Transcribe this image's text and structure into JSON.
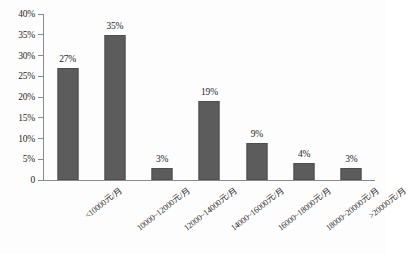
{
  "chart_data": {
    "type": "bar",
    "title": "",
    "xlabel": "",
    "ylabel": "",
    "categories": [
      "<10000元/月",
      "10000~12000元/月",
      "12000~14000元/月",
      "14000~16000元/月",
      "16000~18000元/月",
      "18000~20000元/月",
      ">20000元/月"
    ],
    "values": [
      27,
      35,
      3,
      19,
      9,
      4,
      3
    ],
    "value_labels": [
      "27%",
      "35%",
      "3%",
      "19%",
      "9%",
      "4%",
      "3%"
    ],
    "ylim": [
      0,
      40
    ],
    "ytick_values": [
      0,
      5,
      10,
      15,
      20,
      25,
      30,
      35,
      40
    ],
    "ytick_labels": [
      "0",
      "5%",
      "10%",
      "15%",
      "20%",
      "25%",
      "30%",
      "35%",
      "40%"
    ],
    "grid": false,
    "legend": null,
    "bar_color": "#5c5c5c",
    "axis_color": "#8a8a8a",
    "background_color": "#fdfdfd"
  }
}
